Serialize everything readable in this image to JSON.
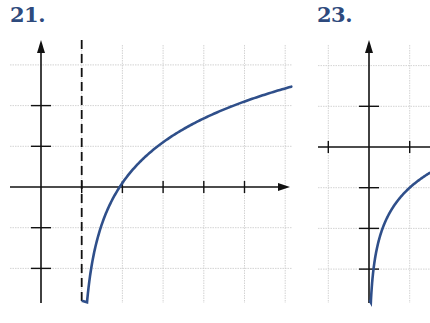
{
  "colors": {
    "curve": "#2f4f8a",
    "axis": "#111111",
    "grid": "#c8c8c8",
    "label": "#2e4a7d"
  },
  "chart_data": [
    {
      "type": "line",
      "label": "21.",
      "title": "",
      "xlabel": "",
      "ylabel": "",
      "grid": true,
      "xlim": [
        -0.75,
        6.15
      ],
      "ylim": [
        -2.85,
        3.0
      ],
      "x_ticks": [
        1,
        2,
        3,
        4,
        5
      ],
      "y_ticks": [
        -2,
        -1,
        1,
        2
      ],
      "vertical_asymptote": 1,
      "series": [
        {
          "name": "logarithmic curve",
          "function": "y = log2(x - 1) + 0.1",
          "x": [
            1.15,
            1.25,
            1.5,
            2,
            3,
            4,
            5,
            6.1
          ],
          "y": [
            -2.64,
            -1.9,
            -0.9,
            0.1,
            1.1,
            1.68,
            2.1,
            2.45
          ]
        }
      ]
    },
    {
      "type": "line",
      "label": "23.",
      "title": "",
      "xlabel": "",
      "ylabel": "",
      "grid": true,
      "xlim": [
        -1.4,
        1.5
      ],
      "ylim": [
        -3.85,
        2.1
      ],
      "x_ticks": [
        -1,
        1
      ],
      "y_ticks": [
        -3,
        -2,
        -1,
        1
      ],
      "vertical_asymptote": 0,
      "series": [
        {
          "name": "logarithmic curve",
          "function": "y = log3(x) - 1",
          "x": [
            0.05,
            0.1,
            0.33,
            1,
            1.5
          ],
          "y": [
            -3.73,
            -3.1,
            -2.0,
            -1.0,
            -0.63
          ]
        }
      ]
    }
  ]
}
